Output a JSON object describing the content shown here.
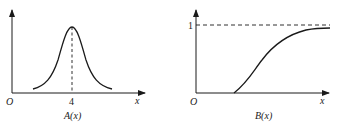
{
  "figures": [
    {
      "id": "A",
      "caption": "A(x)",
      "origin_label": "O",
      "x_axis_label": "x",
      "tick_labels": [
        "4"
      ],
      "curve": "bell-shaped, symmetric, peak at x=4",
      "dashed_line": "vertical at x = 4"
    },
    {
      "id": "B",
      "caption": "B(x)",
      "origin_label": "O",
      "x_axis_label": "x",
      "y_tick_labels": [
        "1"
      ],
      "curve": "S-shaped increasing, approaching 1",
      "dashed_line": "horizontal asymptote at y = 1"
    }
  ],
  "colors": {
    "stroke": "#1a1a1a",
    "text": "#222222"
  }
}
